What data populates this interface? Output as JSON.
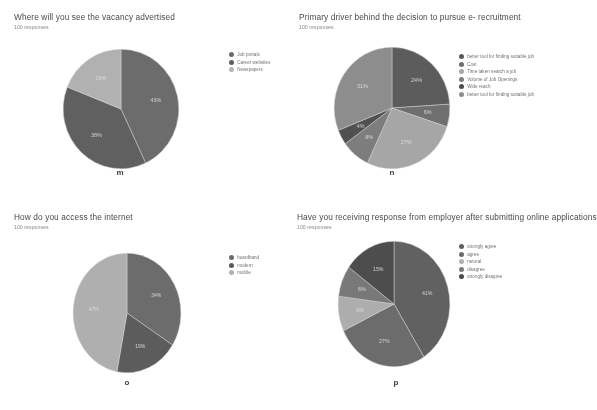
{
  "figure": {
    "background": "#ffffff",
    "style": "grayscale-scan"
  },
  "panels": [
    {
      "id": "m",
      "fig_label": "m",
      "title": "Where will you see the vacancy advertised",
      "subtitle": "100 responses",
      "legend": [
        {
          "label": "Job portals",
          "color": "#6b6b6b"
        },
        {
          "label": "Career websites",
          "color": "#5e5e5e"
        },
        {
          "label": "Newspapers",
          "color": "#b4b4b4"
        }
      ]
    },
    {
      "id": "n",
      "fig_label": "n",
      "title": "Primary driver behind the decision to pursue e- recruitment",
      "subtitle": "100 responses",
      "legend": [
        {
          "label": "better tool for finding suitable job",
          "color": "#5a5a5a"
        },
        {
          "label": "Cost",
          "color": "#6e6e6e"
        },
        {
          "label": "Time taken search a job",
          "color": "#a8a8a8"
        },
        {
          "label": "Volume of Job Openings",
          "color": "#7d7d7d"
        },
        {
          "label": "Wide reach",
          "color": "#4d4d4d"
        },
        {
          "label": "better tool for finding suitable job",
          "color": "#8e8e8e"
        }
      ]
    },
    {
      "id": "o",
      "fig_label": "o",
      "title": "How do you access the internet",
      "subtitle": "100 responses",
      "legend": [
        {
          "label": "boardband",
          "color": "#6b6b6b"
        },
        {
          "label": "modern",
          "color": "#5a5a5a"
        },
        {
          "label": "mobile",
          "color": "#b2b2b2"
        }
      ]
    },
    {
      "id": "p",
      "fig_label": "p",
      "title": "Have you receiving response from employer after submitting online applications",
      "subtitle": "100 responses",
      "legend": [
        {
          "label": "strongly agree",
          "color": "#5f5f5f"
        },
        {
          "label": "agree",
          "color": "#6b6b6b"
        },
        {
          "label": "netural",
          "color": "#b0b0b0"
        },
        {
          "label": "disagree",
          "color": "#787878"
        },
        {
          "label": "strongly disagree",
          "color": "#4a4a4a"
        }
      ]
    }
  ],
  "chart_data": [
    {
      "type": "pie",
      "id": "m",
      "title": "Where will you see the vacancy advertised",
      "subtitle": "100 responses",
      "total_responses": 100,
      "legend_position": "right",
      "categories": [
        "Job portals",
        "Career websites",
        "Newspapers"
      ],
      "values": [
        43,
        38,
        19
      ],
      "labels": [
        "43%",
        "38%",
        "19%"
      ],
      "colors": [
        "#6b6b6b",
        "#5e5e5e",
        "#b4b4b4"
      ]
    },
    {
      "type": "pie",
      "id": "n",
      "title": "Primary driver behind the decision to pursue e- recruitment",
      "subtitle": "100 responses",
      "total_responses": 100,
      "legend_position": "right",
      "categories": [
        "better tool for finding suitable job",
        "Cost",
        "Time taken search a job",
        "Volume of Job Openings",
        "Wide reach",
        "better tool for finding suitable job"
      ],
      "values": [
        24,
        6,
        27,
        8,
        4,
        31
      ],
      "labels": [
        "24%",
        "6%",
        "27%",
        "8%",
        "4%",
        "31%"
      ],
      "colors": [
        "#5a5a5a",
        "#6e6e6e",
        "#a8a8a8",
        "#7d7d7d",
        "#4d4d4d",
        "#8e8e8e"
      ]
    },
    {
      "type": "pie",
      "id": "o",
      "title": "How do you access the internet",
      "subtitle": "100 responses",
      "total_responses": 100,
      "legend_position": "right",
      "categories": [
        "boardband",
        "modern",
        "mobile"
      ],
      "values": [
        34,
        19,
        47
      ],
      "labels": [
        "34%",
        "19%",
        "47%"
      ],
      "colors": [
        "#6b6b6b",
        "#5a5a5a",
        "#b2b2b2"
      ]
    },
    {
      "type": "pie",
      "id": "p",
      "title": "Have you receiving response from employer after submitting online applications",
      "subtitle": "100 responses",
      "total_responses": 100,
      "legend_position": "right",
      "categories": [
        "strongly agree",
        "agree",
        "netural",
        "disagree",
        "strongly disagree"
      ],
      "values": [
        41,
        27,
        9,
        8,
        15
      ],
      "labels": [
        "41%",
        "27%",
        "9%",
        "8%",
        "15%"
      ],
      "colors": [
        "#5f5f5f",
        "#6b6b6b",
        "#b0b0b0",
        "#787878",
        "#4a4a4a"
      ]
    }
  ]
}
